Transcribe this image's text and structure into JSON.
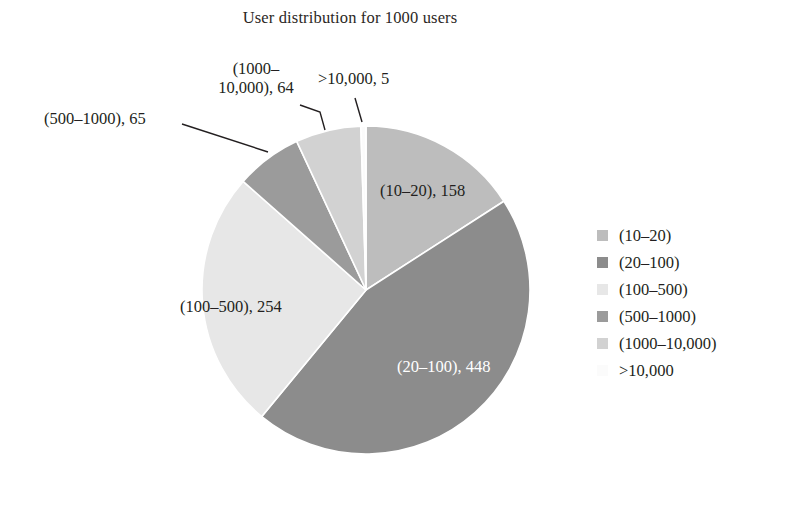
{
  "title": "User distribution for 1000 users",
  "background": "#ffffff",
  "chart_data": {
    "type": "pie",
    "title": "User distribution for 1000 users",
    "xlabel": "",
    "ylabel": "",
    "total": 994,
    "start_angle_deg": 0,
    "direction": "clockwise",
    "legend_position": "right",
    "grid": false,
    "categories": [
      "(10–20)",
      "(20–100)",
      "(100–500)",
      "(500–1000)",
      "(1000–10,000)",
      ">10,000"
    ],
    "values": [
      158,
      448,
      254,
      65,
      64,
      5
    ],
    "colors": [
      "#bdbdbd",
      "#8c8c8c",
      "#e7e7e7",
      "#9b9b9b",
      "#d2d2d2",
      "#fbfbfb"
    ],
    "slices": [
      {
        "name": "(10–20)",
        "value": 158,
        "color": "#bdbdbd",
        "label": "(10–20), 158",
        "label_placement": "inside",
        "label_color": "#231f20"
      },
      {
        "name": "(20–100)",
        "value": 448,
        "color": "#8c8c8c",
        "label": "(20–100), 448",
        "label_placement": "inside",
        "label_color": "#ffffff"
      },
      {
        "name": "(100–500)",
        "value": 254,
        "color": "#e7e7e7",
        "label": "(100–500), 254",
        "label_placement": "inside",
        "label_color": "#231f20"
      },
      {
        "name": "(500–1000)",
        "value": 65,
        "color": "#9b9b9b",
        "label": "(500–1000), 65",
        "label_placement": "callout",
        "label_color": "#231f20"
      },
      {
        "name": "(1000–10,000)",
        "value": 64,
        "color": "#d2d2d2",
        "label": "(1000–10,000), 64",
        "label_line1": "(1000–",
        "label_line2": "10,000), 64",
        "label_placement": "callout",
        "label_color": "#231f20"
      },
      {
        "name": ">10,000",
        "value": 5,
        "color": "#fbfbfb",
        "label": ">10,000, 5",
        "label_placement": "callout",
        "label_color": "#231f20"
      }
    ]
  },
  "slice_labels": {
    "s10_20": "(10–20), 158",
    "s20_100": "(20–100), 448",
    "s100_500": "(100–500), 254",
    "s500_1000": "(500–1000), 65",
    "s1000_10000_line1": "(1000–",
    "s1000_10000_line2": "10,000), 64",
    "gt10000": ">10,000, 5"
  },
  "legend": {
    "items": [
      {
        "label": "(10–20)",
        "color": "#bdbdbd"
      },
      {
        "label": "(20–100)",
        "color": "#8c8c8c"
      },
      {
        "label": "(100–500)",
        "color": "#e7e7e7"
      },
      {
        "label": "(500–1000)",
        "color": "#9b9b9b"
      },
      {
        "label": "(1000–10,000)",
        "color": "#d2d2d2"
      },
      {
        "label": ">10,000",
        "color": "#fbfbfb"
      }
    ]
  }
}
